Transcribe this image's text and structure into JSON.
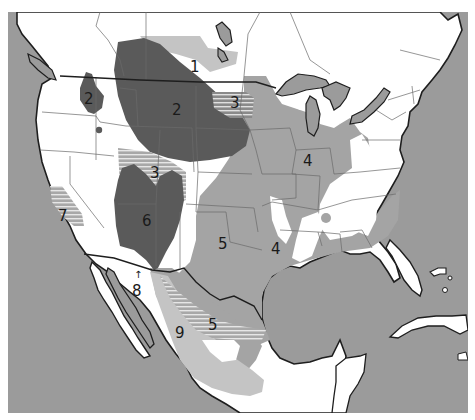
{
  "map": {
    "subject": "North America regional zones map",
    "colors": {
      "water": "#9b9b9b",
      "land": "#ffffff",
      "region_dark": "#5a5a5a",
      "region_medium": "#a4a4a4",
      "region_light": "#c4c4c4",
      "hatch": "#d8d8d8",
      "border": "#1e1e1e",
      "state_line": "#6a6a6a"
    },
    "regions": [
      {
        "id": "1",
        "label": "1",
        "shade": "light",
        "area": "Canadian prairies"
      },
      {
        "id": "2a",
        "label": "2",
        "shade": "dark",
        "area": "Eastern Washington"
      },
      {
        "id": "2b",
        "label": "2",
        "shade": "dark",
        "area": "Northern Great Plains"
      },
      {
        "id": "3a",
        "label": "3",
        "shade": "hatched",
        "area": "Dakotas/Minnesota border"
      },
      {
        "id": "3b",
        "label": "3",
        "shade": "hatched",
        "area": "Utah/Colorado"
      },
      {
        "id": "4a",
        "label": "4",
        "shade": "medium",
        "area": "Midwest"
      },
      {
        "id": "4b",
        "label": "4",
        "shade": "medium",
        "area": "Eastern Texas"
      },
      {
        "id": "5a",
        "label": "5",
        "shade": "medium",
        "area": "Southern Plains"
      },
      {
        "id": "5b",
        "label": "5",
        "shade": "hatched",
        "area": "Northern Mexico"
      },
      {
        "id": "6",
        "label": "6",
        "shade": "dark",
        "area": "Four Corners"
      },
      {
        "id": "7",
        "label": "7",
        "shade": "hatched",
        "area": "Central California"
      },
      {
        "id": "8",
        "label": "8",
        "shade": "white",
        "area": "Sonoran coast",
        "arrow": "↑"
      },
      {
        "id": "9",
        "label": "9",
        "shade": "light",
        "area": "Sierra Madre"
      }
    ]
  }
}
